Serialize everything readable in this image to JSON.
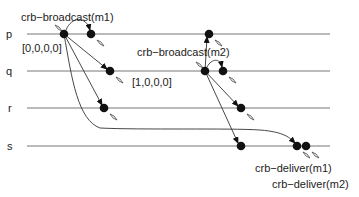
{
  "diagram": {
    "processes": [
      {
        "name": "p",
        "y": 34
      },
      {
        "name": "q",
        "y": 71
      },
      {
        "name": "r",
        "y": 108
      },
      {
        "name": "s",
        "y": 146
      }
    ],
    "labels": {
      "broadcast_m1": "crb−broadcast(m1)",
      "broadcast_m2": "crb−broadcast(m2)",
      "clock_p": "[0,0,0,0]",
      "clock_q": "[1,0,0,0]",
      "deliver_m1": "crb−deliver(m1)",
      "deliver_m2": "crb−deliver(m2)"
    },
    "colors": {
      "timeline": "#777777",
      "event": "#111111",
      "text": "#222222"
    }
  }
}
